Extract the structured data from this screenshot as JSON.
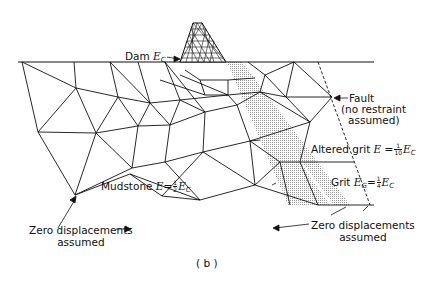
{
  "figure": {
    "panel_label": "( b )",
    "colors": {
      "line": "#111111",
      "hatch": "#bdbdbd",
      "background": "#ffffff"
    }
  },
  "labels": {
    "dam": {
      "text": "Dam",
      "symbol": "E",
      "subscript": "C"
    },
    "fault": {
      "line1": "Fault",
      "line2": "(no restraint",
      "line3": "assumed)"
    },
    "altered_grit": {
      "text": "Altered grit",
      "symbol": "E =",
      "num": "1",
      "den": "10",
      "tail": "E",
      "tail_sub": "C"
    },
    "grit": {
      "text": "Grit",
      "symbol": "E",
      "symbol_sub": "G",
      "eq": "=",
      "num": "1",
      "den": "4",
      "tail": "E",
      "tail_sub": "C"
    },
    "mudstone": {
      "text": "Mudstone",
      "symbol": "E=",
      "num": "1",
      "den": "2",
      "tail": "E",
      "tail_sub": "C"
    },
    "zero_left": {
      "line1": "Zero displacements",
      "line2": "assumed"
    },
    "zero_right": {
      "line1": "Zero displacements",
      "line2": "assumed"
    }
  }
}
